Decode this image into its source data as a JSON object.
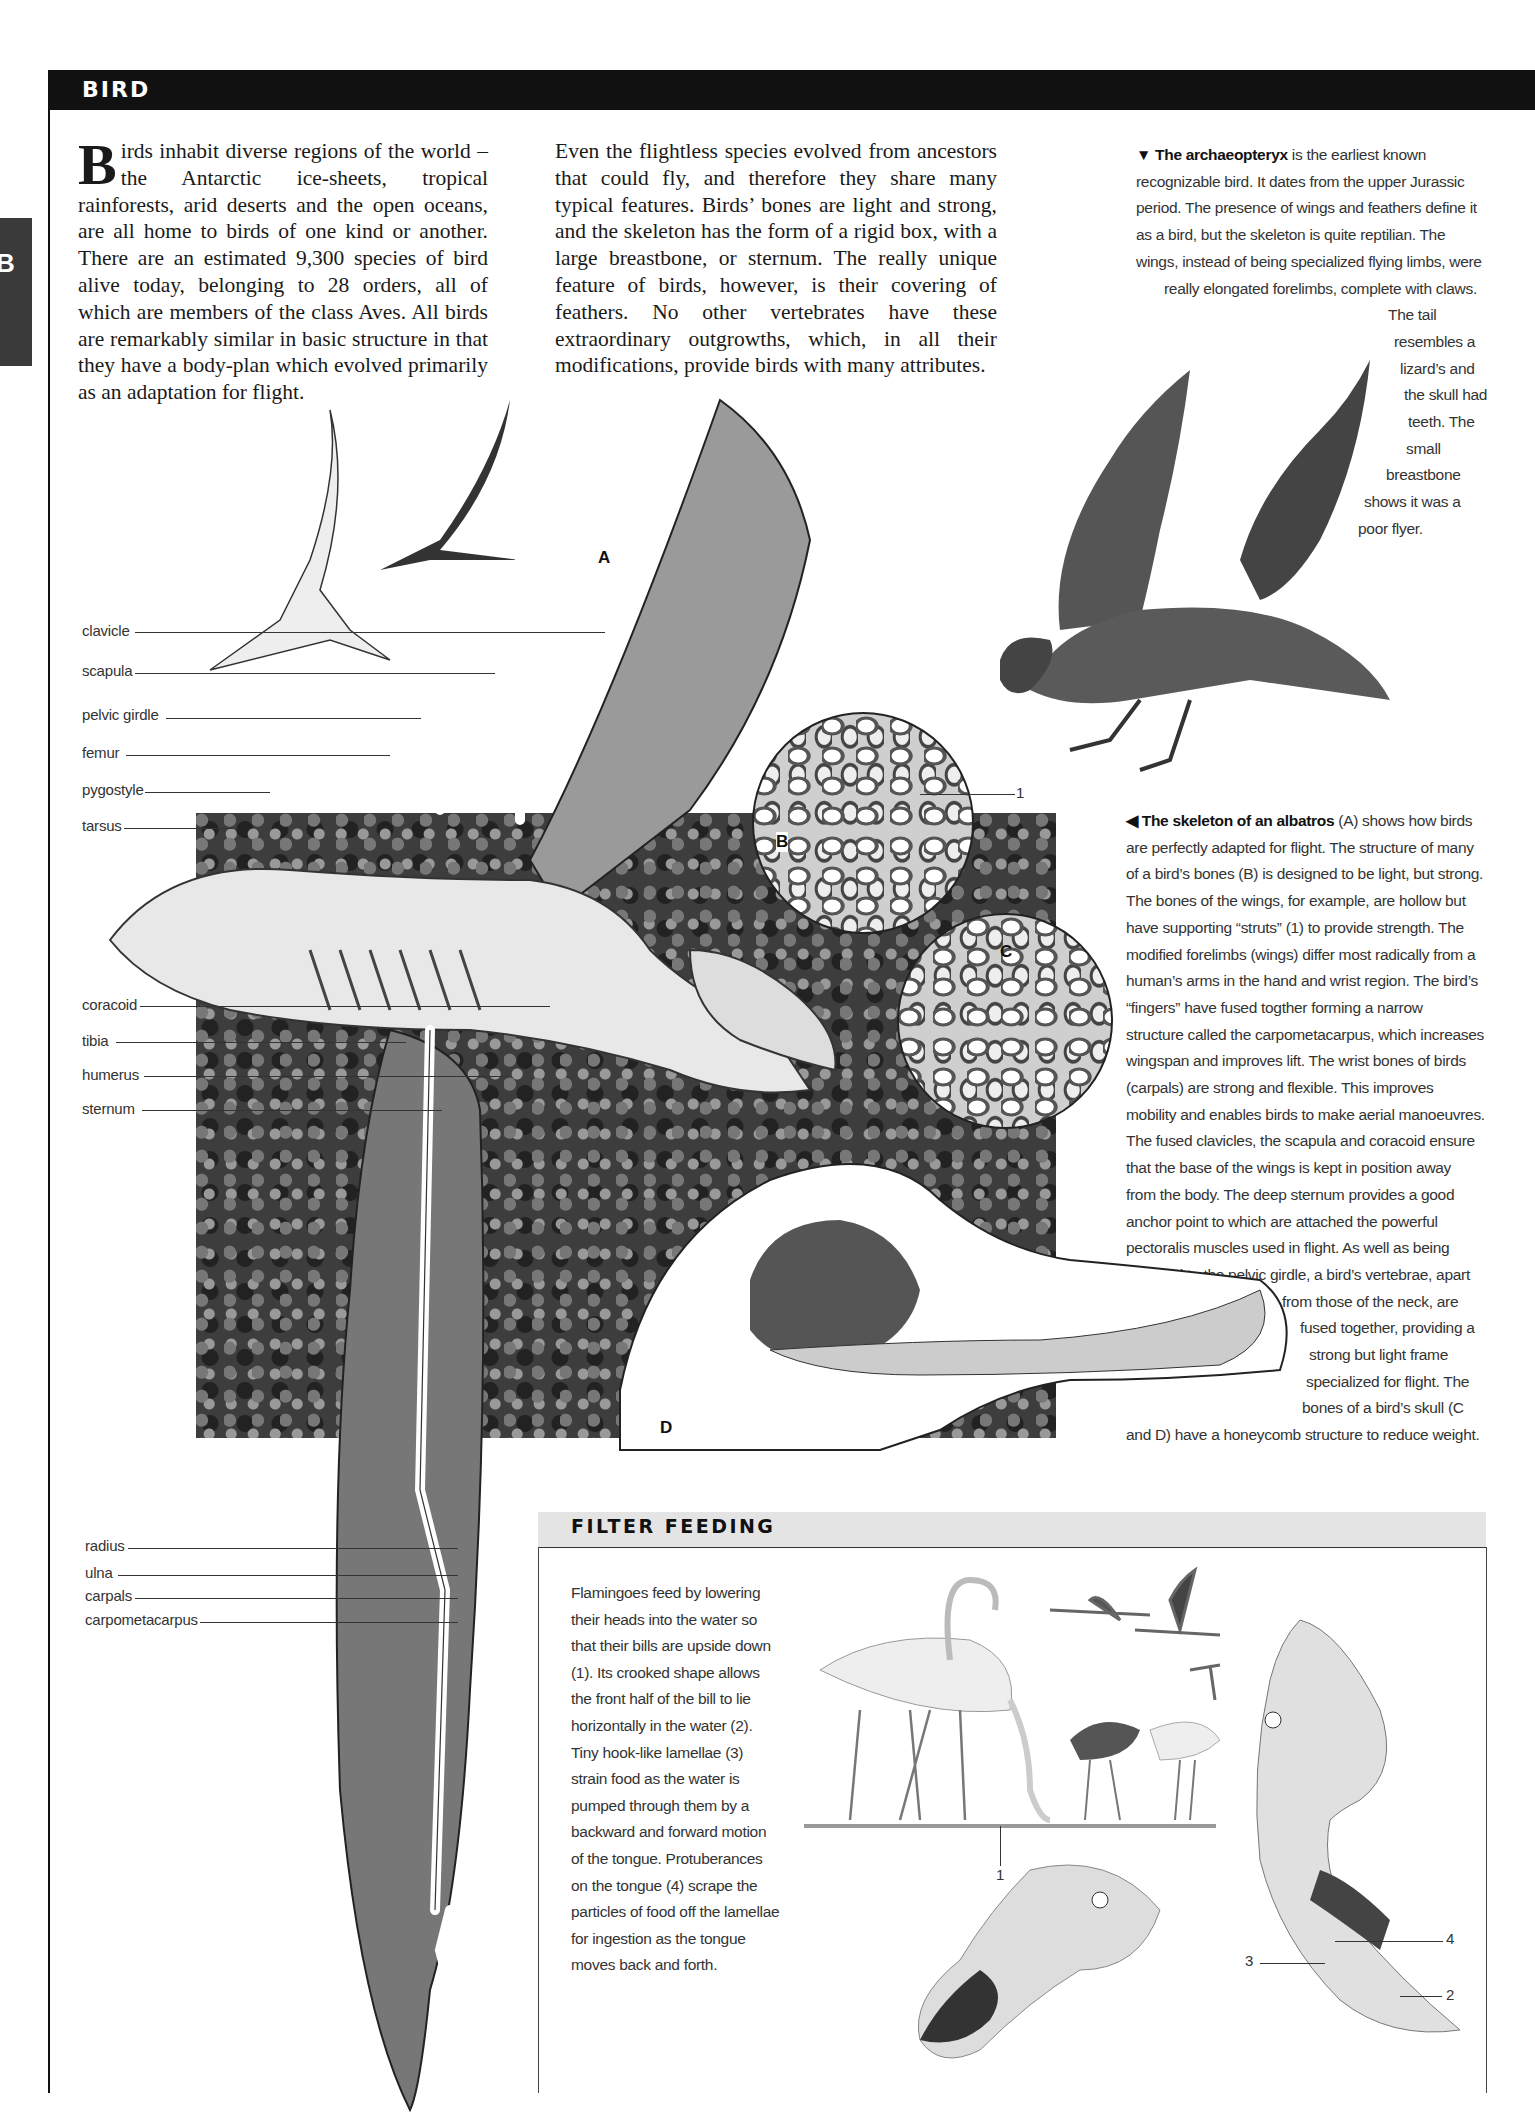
{
  "header": {
    "title": "BIRD",
    "thumb_tab_letter": "B"
  },
  "intro": {
    "dropcap": "B",
    "col1": "irds inhabit diverse regions of the world – the Antarctic ice-sheets, tropical rainforests, arid deserts and the open oceans, are all home to birds of one kind or another. There are an estimated 9,300 species of bird alive today, belonging to 28 orders, all of which are members of the class Aves. All birds are remarkably similar in basic structure in that they have a body-plan which evolved primarily as an adaptation for flight.",
    "col2": "Even the flightless species evolved from ancestors that could fly, and therefore they share many typical features. Birds’ bones are light and strong, and the skeleton has the form of a rigid box, with a large breastbone, or sternum. The really unique feature of birds, however, is their covering of feathers. No other vertebrates have these extraordinary outgrowths, which, in all their modifications, provide birds with many attributes."
  },
  "archaeopteryx_caption": {
    "marker": "▼",
    "bold_lead": "The archaeopteryx",
    "lines": [
      " is the earliest known",
      "recognizable bird. It dates from the upper Jurassic",
      "period. The presence of wings and feathers define it",
      "as a bird, but the skeleton is quite reptilian. The",
      "wings, instead of being specialized flying limbs, were",
      "really elongated forelimbs, complete with claws.",
      "The tail",
      "resembles a",
      "lizard’s and",
      "the skull had",
      "teeth. The",
      "small",
      "breastbone",
      "shows it was a",
      "poor flyer."
    ]
  },
  "albatross_caption": {
    "marker": "◀",
    "bold_lead": "The skeleton of an albatros",
    "lines": [
      " (A) shows how birds",
      "are perfectly adapted for flight. The structure of many",
      "of a bird’s bones (B) is designed to be light, but strong.",
      "The bones of the wings, for example, are hollow but",
      "have supporting “struts” (1) to provide strength. The",
      "modified forelimbs (wings) differ most radically from a",
      "human’s arms in the hand and wrist region. The bird’s",
      "“fingers” have fused togther forming a narrow",
      "structure called the carpometacarpus, which increases",
      "wingspan and improves lift. The wrist bones of birds",
      "(carpals) are strong and flexible. This improves",
      "mobility and enables birds to make aerial manoeuvres.",
      "The fused clavicles, the scapula and coracoid ensure",
      "that the base of the wings is kept in position away",
      "from the body. The deep sternum provides a good",
      "anchor point to which are attached the powerful",
      "pectoralis muscles used in flight. As well as being",
      "attached to the pelvic girdle, a bird’s vertebrae, apart",
      "from those of the neck, are",
      "fused together, providing a",
      "strong but light frame",
      "specialized for flight. The",
      "bones of a bird’s skull (C",
      "and D) have a honeycomb structure to reduce weight."
    ]
  },
  "skeleton_labels": {
    "upper": [
      "clavicle",
      "scapula",
      "pelvic girdle",
      "femur",
      "pygostyle",
      "tarsus"
    ],
    "middle": [
      "coracoid",
      "tibia",
      "humerus",
      "sternum"
    ],
    "lower": [
      "radius",
      "ulna",
      "carpals",
      "carpometacarpus"
    ]
  },
  "diagram_letters": {
    "a": "A",
    "b": "B",
    "c": "C",
    "d": "D",
    "strut_number": "1"
  },
  "filter_feeding": {
    "title": "FILTER FEEDING",
    "text": "Flamingoes feed by lowering their heads into the water so that their bills are upside down (1). Its crooked shape allows the front half of the bill to lie horizontally in the water (2). Tiny hook-like lamellae (3) strain food as the water is pumped through them by a backward and forward motion of the tongue. Protuberances on the tongue (4) scrape the particles of food off the lamellae for ingestion as the tongue moves back and forth.",
    "callouts": {
      "one": "1",
      "two": "2",
      "three": "3",
      "four": "4"
    }
  }
}
